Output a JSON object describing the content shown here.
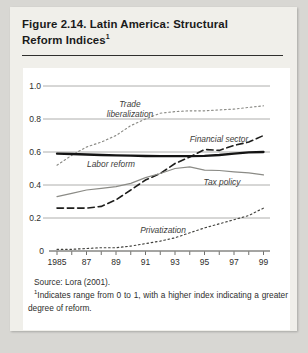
{
  "figure": {
    "title_lines": [
      "Figure 2.14. Latin America: Structural",
      "Reform Indices"
    ],
    "title_superscript": "1",
    "source_line": "Source: Lora (2001).",
    "footnote_superscript": "1",
    "footnote_text": "Indicates range from 0 to 1, with a higher index indicating a greater degree of reform."
  },
  "colors": {
    "page_background": "#d8d7d3",
    "card_background": "#f0efea",
    "panel_background": "#ffffff",
    "title_text": "#1a1a1a",
    "grid_line": "#9b9b97",
    "axis_line": "#4b4b47",
    "dark_series": "#1e1e1c",
    "grey_series": "#8b8b86"
  },
  "chart_data": {
    "type": "line",
    "title": "",
    "xlabel": "",
    "ylabel": "",
    "x": [
      1985,
      1986,
      1987,
      1988,
      1989,
      1990,
      1991,
      1992,
      1993,
      1994,
      1995,
      1996,
      1997,
      1998,
      1999
    ],
    "xticks": [
      {
        "label": "1985",
        "year": 1985
      },
      {
        "label": "87",
        "year": 1987
      },
      {
        "label": "89",
        "year": 1989
      },
      {
        "label": "91",
        "year": 1991
      },
      {
        "label": "93",
        "year": 1993
      },
      {
        "label": "95",
        "year": 1995
      },
      {
        "label": "97",
        "year": 1997
      },
      {
        "label": "99",
        "year": 1999
      }
    ],
    "yticks": [
      {
        "label": "1.0",
        "value": 1.0
      },
      {
        "label": "0.8",
        "value": 0.8
      },
      {
        "label": "0.6",
        "value": 0.6
      },
      {
        "label": "0.4",
        "value": 0.4
      },
      {
        "label": "0.2",
        "value": 0.2
      },
      {
        "label": "0",
        "value": 0.0
      }
    ],
    "ylim": [
      0,
      1.05
    ],
    "grid": true,
    "legend_position": "inline-annotations",
    "series": [
      {
        "id": "trade_liberalization",
        "name": "Trade liberalization",
        "line_style": "dotted",
        "color": "#8b8b86",
        "values": [
          0.52,
          0.58,
          0.63,
          0.66,
          0.7,
          0.76,
          0.8,
          0.835,
          0.845,
          0.85,
          0.85,
          0.855,
          0.86,
          0.87,
          0.88
        ]
      },
      {
        "id": "financial_sector",
        "name": "Financial sector",
        "line_style": "dashed",
        "color": "#1e1e1c",
        "values": [
          0.26,
          0.26,
          0.26,
          0.27,
          0.31,
          0.37,
          0.43,
          0.47,
          0.53,
          0.57,
          0.615,
          0.61,
          0.64,
          0.66,
          0.7
        ]
      },
      {
        "id": "labor_reform",
        "name": "Labor reform",
        "line_style": "solid",
        "color": "#141414",
        "values": [
          0.59,
          0.588,
          0.585,
          0.582,
          0.58,
          0.578,
          0.576,
          0.575,
          0.575,
          0.575,
          0.577,
          0.582,
          0.59,
          0.598,
          0.6
        ]
      },
      {
        "id": "tax_policy",
        "name": "Tax policy",
        "line_style": "solid",
        "color": "#8b8b86",
        "values": [
          0.33,
          0.35,
          0.37,
          0.38,
          0.39,
          0.41,
          0.445,
          0.47,
          0.5,
          0.51,
          0.49,
          0.488,
          0.48,
          0.474,
          0.462
        ]
      },
      {
        "id": "privatization",
        "name": "Privatization",
        "line_style": "dotted",
        "color": "#42423e",
        "values": [
          0.01,
          0.01,
          0.015,
          0.02,
          0.02,
          0.03,
          0.045,
          0.06,
          0.08,
          0.11,
          0.14,
          0.165,
          0.19,
          0.215,
          0.26
        ]
      }
    ]
  }
}
